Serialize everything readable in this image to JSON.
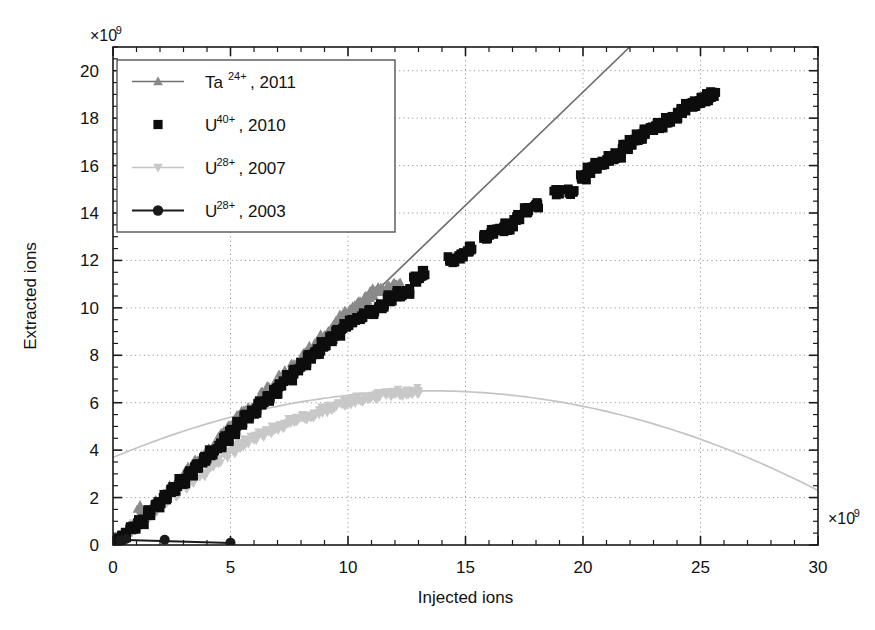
{
  "chart_data": {
    "type": "scatter",
    "title": "",
    "xlabel": "Injected ions",
    "ylabel": "Extracted ions",
    "x_exponent_label": "×10",
    "x_exponent_sup": "9",
    "y_exponent_label": "×10",
    "y_exponent_sup": "9",
    "xlim": [
      0,
      30
    ],
    "ylim": [
      0,
      21
    ],
    "x_ticks": [
      0,
      5,
      10,
      15,
      20,
      25,
      30
    ],
    "x_tick_labels": [
      "0",
      "5",
      "10",
      "15",
      "20",
      "25",
      "30"
    ],
    "x_minor_step": 1,
    "y_ticks": [
      0,
      2,
      4,
      6,
      8,
      10,
      12,
      14,
      16,
      18,
      20
    ],
    "y_tick_labels": [
      "0",
      "2",
      "4",
      "6",
      "8",
      "10",
      "12",
      "14",
      "16",
      "18",
      "20"
    ],
    "y_minor_step": 0.5,
    "grid": "dotted-both-major",
    "legend_position": "upper-left-inside",
    "series": [
      {
        "name": "Ta24-2011",
        "label_base": "Ta",
        "label_sup": "24+",
        "label_tail": ", 2011",
        "marker": "triangle-up",
        "color": "#8a8a8a",
        "line": true,
        "line_color": "#707070",
        "points": [
          [
            0.15,
            0.12
          ],
          [
            0.4,
            0.35
          ],
          [
            0.7,
            0.62
          ],
          [
            1.0,
            0.9
          ],
          [
            1.15,
            1.55
          ],
          [
            1.3,
            1.2
          ],
          [
            1.6,
            1.5
          ],
          [
            1.9,
            1.8
          ],
          [
            2.2,
            2.1
          ],
          [
            2.5,
            2.4
          ],
          [
            2.8,
            2.7
          ],
          [
            3.05,
            2.95
          ],
          [
            3.3,
            3.2
          ],
          [
            3.6,
            3.5
          ],
          [
            3.85,
            3.75
          ],
          [
            4.1,
            4.0
          ],
          [
            4.35,
            4.3
          ],
          [
            4.55,
            4.45
          ],
          [
            4.7,
            4.62
          ],
          [
            4.85,
            4.78
          ],
          [
            5.0,
            4.95
          ],
          [
            5.2,
            5.15
          ],
          [
            5.4,
            5.35
          ],
          [
            5.6,
            5.55
          ],
          [
            5.8,
            5.72
          ],
          [
            6.0,
            5.9
          ],
          [
            6.2,
            6.1
          ],
          [
            6.45,
            6.35
          ],
          [
            6.7,
            6.6
          ],
          [
            6.95,
            6.85
          ],
          [
            7.2,
            7.05
          ],
          [
            7.45,
            7.3
          ],
          [
            7.7,
            7.55
          ],
          [
            7.95,
            7.8
          ],
          [
            8.2,
            8.05
          ],
          [
            8.45,
            8.3
          ],
          [
            8.7,
            8.5
          ],
          [
            8.95,
            8.78
          ],
          [
            9.2,
            9.0
          ],
          [
            9.4,
            9.2
          ],
          [
            9.6,
            9.4
          ],
          [
            9.8,
            9.6
          ],
          [
            10.0,
            9.8
          ],
          [
            10.2,
            9.95
          ],
          [
            10.4,
            10.1
          ],
          [
            10.55,
            10.25
          ],
          [
            10.7,
            10.4
          ],
          [
            10.85,
            10.5
          ],
          [
            11.0,
            10.6
          ],
          [
            11.2,
            10.7
          ],
          [
            11.4,
            10.75
          ],
          [
            11.6,
            10.8
          ],
          [
            11.8,
            10.85
          ],
          [
            11.95,
            10.9
          ],
          [
            12.1,
            10.95
          ]
        ],
        "trendline": {
          "type": "linear",
          "slope": 0.955,
          "intercept": 0.0,
          "x_from": 0.0,
          "x_to": 22.0
        }
      },
      {
        "name": "U40-2010",
        "label_base": "U",
        "label_sup": "40+",
        "label_tail": ", 2010",
        "marker": "square",
        "color": "#0d0d0d",
        "line": false,
        "points": [
          [
            0.2,
            0.15
          ],
          [
            0.5,
            0.4
          ],
          [
            0.85,
            0.7
          ],
          [
            1.2,
            1.0
          ],
          [
            1.55,
            1.35
          ],
          [
            1.9,
            1.7
          ],
          [
            2.25,
            2.0
          ],
          [
            2.6,
            2.35
          ],
          [
            2.95,
            2.7
          ],
          [
            3.3,
            3.05
          ],
          [
            3.6,
            3.3
          ],
          [
            3.9,
            3.6
          ],
          [
            4.2,
            3.9
          ],
          [
            4.5,
            4.2
          ],
          [
            4.8,
            4.5
          ],
          [
            5.1,
            4.8
          ],
          [
            5.4,
            5.1
          ],
          [
            5.7,
            5.4
          ],
          [
            6.0,
            5.65
          ],
          [
            6.3,
            5.95
          ],
          [
            6.6,
            6.2
          ],
          [
            6.9,
            6.5
          ],
          [
            7.2,
            6.8
          ],
          [
            7.5,
            7.05
          ],
          [
            7.8,
            7.35
          ],
          [
            8.1,
            7.6
          ],
          [
            8.4,
            7.9
          ],
          [
            8.7,
            8.15
          ],
          [
            9.0,
            8.45
          ],
          [
            9.3,
            8.7
          ],
          [
            9.6,
            8.95
          ],
          [
            9.9,
            9.25
          ],
          [
            10.2,
            9.5
          ],
          [
            10.5,
            9.65
          ],
          [
            11.0,
            9.85
          ],
          [
            11.4,
            10.1
          ],
          [
            11.8,
            10.4
          ],
          [
            12.2,
            10.6
          ],
          [
            12.5,
            10.7
          ],
          [
            12.9,
            11.2
          ],
          [
            13.2,
            11.45
          ],
          [
            14.4,
            12.05
          ],
          [
            14.8,
            12.2
          ],
          [
            15.2,
            12.5
          ],
          [
            15.9,
            13.0
          ],
          [
            16.2,
            13.2
          ],
          [
            16.5,
            13.3
          ],
          [
            16.7,
            13.45
          ],
          [
            16.9,
            13.35
          ],
          [
            17.2,
            13.8
          ],
          [
            17.6,
            14.1
          ],
          [
            18.0,
            14.3
          ],
          [
            18.9,
            14.85
          ],
          [
            19.5,
            14.9
          ],
          [
            20.0,
            15.5
          ],
          [
            20.3,
            15.8
          ],
          [
            20.6,
            16.0
          ],
          [
            20.9,
            16.15
          ],
          [
            21.2,
            16.3
          ],
          [
            21.5,
            16.45
          ],
          [
            21.8,
            16.8
          ],
          [
            22.1,
            17.0
          ],
          [
            22.4,
            17.2
          ],
          [
            22.7,
            17.4
          ],
          [
            23.0,
            17.6
          ],
          [
            23.3,
            17.7
          ],
          [
            23.6,
            17.9
          ],
          [
            23.9,
            18.1
          ],
          [
            24.1,
            18.3
          ],
          [
            24.3,
            18.4
          ],
          [
            24.5,
            18.5
          ],
          [
            24.7,
            18.6
          ],
          [
            24.85,
            18.65
          ],
          [
            25.0,
            18.75
          ],
          [
            25.1,
            18.8
          ],
          [
            25.2,
            18.85
          ],
          [
            25.3,
            18.9
          ],
          [
            25.4,
            18.9
          ],
          [
            25.45,
            18.95
          ],
          [
            25.5,
            19.0
          ]
        ]
      },
      {
        "name": "U28-2007",
        "label_base": "U",
        "label_sup": "28+",
        "label_tail": ", 2007",
        "marker": "triangle-down",
        "color": "#c8c8c8",
        "line": true,
        "line_color": "#c4c4c4",
        "points": [
          [
            0.2,
            0.15
          ],
          [
            0.6,
            0.5
          ],
          [
            1.0,
            0.85
          ],
          [
            1.4,
            1.2
          ],
          [
            1.8,
            1.5
          ],
          [
            2.2,
            1.85
          ],
          [
            2.6,
            2.15
          ],
          [
            3.0,
            2.45
          ],
          [
            3.4,
            2.75
          ],
          [
            3.8,
            3.0
          ],
          [
            4.2,
            3.3
          ],
          [
            4.5,
            3.55
          ],
          [
            4.8,
            3.8
          ],
          [
            5.1,
            4.0
          ],
          [
            5.4,
            4.2
          ],
          [
            5.7,
            4.35
          ],
          [
            6.0,
            4.5
          ],
          [
            6.3,
            4.65
          ],
          [
            6.6,
            4.8
          ],
          [
            6.9,
            4.95
          ],
          [
            7.2,
            5.05
          ],
          [
            7.5,
            5.2
          ],
          [
            7.8,
            5.3
          ],
          [
            8.1,
            5.4
          ],
          [
            8.4,
            5.5
          ],
          [
            8.7,
            5.6
          ],
          [
            9.0,
            5.7
          ],
          [
            9.3,
            5.8
          ],
          [
            9.6,
            5.9
          ],
          [
            9.9,
            6.0
          ],
          [
            10.2,
            6.05
          ],
          [
            10.5,
            6.15
          ],
          [
            10.8,
            6.2
          ],
          [
            11.1,
            6.25
          ],
          [
            11.4,
            6.3
          ],
          [
            11.7,
            6.35
          ],
          [
            12.0,
            6.45
          ],
          [
            12.3,
            6.4
          ],
          [
            12.6,
            6.45
          ],
          [
            12.9,
            6.5
          ]
        ],
        "trendline": {
          "type": "quadratic-peak",
          "peak_x": 13.5,
          "peak_y": 6.5,
          "x_from": 0.0,
          "x_to": 30.0,
          "y_at_30": 2.3
        }
      },
      {
        "name": "U28-2003",
        "label_base": "U",
        "label_sup": "28+",
        "label_tail": ", 2003",
        "marker": "circle",
        "color": "#1a1a1a",
        "line": true,
        "line_color": "#1a1a1a",
        "points": [
          [
            0.3,
            0.2
          ],
          [
            0.55,
            0.25
          ],
          [
            2.2,
            0.22
          ],
          [
            5.0,
            0.1
          ]
        ],
        "trendline": {
          "type": "flat",
          "x_from": 0.2,
          "x_to": 5.0,
          "y_from": 0.22,
          "y_to": 0.08
        }
      }
    ]
  }
}
